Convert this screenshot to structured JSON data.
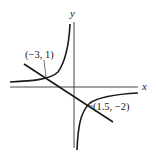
{
  "diagram": {
    "axes": {
      "x_label": "x",
      "y_label": "y"
    },
    "points": [
      {
        "label": "(−3, 1)",
        "x": -3,
        "y": 1
      },
      {
        "label": "(1.5, −2)",
        "x": 1.5,
        "y": -2
      }
    ],
    "curves": [
      {
        "type": "hyperbola",
        "description": "two branches, upper-left and lower-right quadrants"
      },
      {
        "type": "line",
        "description": "line through (-3, 1) and (1.5, -2)"
      }
    ],
    "colors": {
      "stroke": "#1a1a1a",
      "axis": "#333333",
      "background": "#ffffff"
    }
  }
}
